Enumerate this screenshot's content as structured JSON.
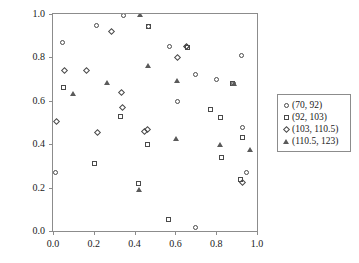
{
  "chart_data": {
    "type": "scatter",
    "title": "",
    "xlabel": "",
    "ylabel": "",
    "xlim": [
      0.0,
      1.0
    ],
    "ylim": [
      0.0,
      1.0
    ],
    "grid": false,
    "legend_position": "right",
    "xticks": [
      "0.0",
      "0.2",
      "0.4",
      "0.6",
      "0.8",
      "1.0"
    ],
    "xtick_values": [
      0.0,
      0.2,
      0.4,
      0.6,
      0.8,
      1.0
    ],
    "yticks": [
      "0.0",
      "0.2",
      "0.4",
      "0.6",
      "0.8",
      "1.0"
    ],
    "ytick_values": [
      0.0,
      0.2,
      0.4,
      0.6,
      0.8,
      1.0
    ],
    "series": [
      {
        "name": "(70, 92)",
        "marker": "circle",
        "points": [
          [
            0.012,
            0.268
          ],
          [
            0.045,
            0.87
          ],
          [
            0.215,
            0.946
          ],
          [
            0.345,
            0.994
          ],
          [
            0.47,
            0.944
          ],
          [
            0.57,
            0.849
          ],
          [
            0.61,
            0.597
          ],
          [
            0.655,
            0.849
          ],
          [
            0.7,
            0.018
          ],
          [
            0.7,
            0.722
          ],
          [
            0.8,
            0.699
          ],
          [
            0.885,
            0.681
          ],
          [
            0.925,
            0.811
          ],
          [
            0.93,
            0.476
          ],
          [
            0.95,
            0.268
          ]
        ]
      },
      {
        "name": "(92, 103)",
        "marker": "square",
        "points": [
          [
            0.05,
            0.66
          ],
          [
            0.205,
            0.311
          ],
          [
            0.33,
            0.527
          ],
          [
            0.42,
            0.217
          ],
          [
            0.465,
            0.4
          ],
          [
            0.47,
            0.944
          ],
          [
            0.565,
            0.053
          ],
          [
            0.66,
            0.845
          ],
          [
            0.77,
            0.56
          ],
          [
            0.82,
            0.522
          ],
          [
            0.825,
            0.34
          ],
          [
            0.88,
            0.681
          ],
          [
            0.92,
            0.238
          ],
          [
            0.93,
            0.433
          ]
        ]
      },
      {
        "name": "(103, 110.5)",
        "marker": "diamond",
        "points": [
          [
            0.018,
            0.506
          ],
          [
            0.055,
            0.74
          ],
          [
            0.165,
            0.741
          ],
          [
            0.22,
            0.452
          ],
          [
            0.285,
            0.918
          ],
          [
            0.335,
            0.64
          ],
          [
            0.34,
            0.57
          ],
          [
            0.45,
            0.46
          ],
          [
            0.465,
            0.468
          ],
          [
            0.61,
            0.798
          ],
          [
            0.655,
            0.851
          ],
          [
            0.93,
            0.222
          ]
        ]
      },
      {
        "name": "(110.5, 123)",
        "marker": "triangle",
        "points": [
          [
            0.1,
            0.633
          ],
          [
            0.265,
            0.684
          ],
          [
            0.42,
            0.19
          ],
          [
            0.425,
            0.996
          ],
          [
            0.465,
            0.764
          ],
          [
            0.605,
            0.425
          ],
          [
            0.61,
            0.694
          ],
          [
            0.82,
            0.4
          ],
          [
            0.885,
            0.681
          ],
          [
            0.965,
            0.376
          ]
        ]
      }
    ]
  }
}
